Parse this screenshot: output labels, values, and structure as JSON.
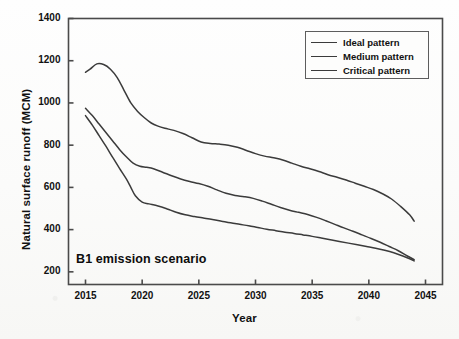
{
  "chart_data": {
    "type": "line",
    "title": "",
    "annotation": "B1 emission scenario",
    "xlabel": "Year",
    "ylabel": "Natural surface runoff (MCM)",
    "xlim": [
      2013.5,
      2046.5
    ],
    "ylim": [
      140,
      1400
    ],
    "xticks": [
      2015,
      2020,
      2025,
      2030,
      2035,
      2040,
      2045
    ],
    "yticks": [
      200,
      400,
      600,
      800,
      1000,
      1200,
      1400
    ],
    "grid": false,
    "legend_position": "top-right",
    "line_color": "#3b3b3b",
    "frame_color": "#4a4a4a",
    "series": [
      {
        "name": "Ideal pattern",
        "x": [
          2015.0,
          2015.4,
          2016.0,
          2016.6,
          2017.2,
          2017.8,
          2018.4,
          2019.0,
          2019.6,
          2020.2,
          2020.8,
          2021.4,
          2022.0,
          2022.8,
          2023.6,
          2024.4,
          2025.2,
          2026.0,
          2026.8,
          2027.6,
          2028.4,
          2029.2,
          2030.0,
          2030.8,
          2031.6,
          2032.4,
          2033.2,
          2034.0,
          2034.8,
          2035.6,
          2036.4,
          2037.2,
          2038.0,
          2038.8,
          2039.6,
          2040.4,
          2041.2,
          2042.0,
          2042.8,
          2043.6,
          2044.0
        ],
        "y": [
          1145,
          1160,
          1185,
          1182,
          1160,
          1120,
          1060,
          1000,
          960,
          930,
          905,
          890,
          880,
          870,
          855,
          835,
          815,
          808,
          805,
          800,
          790,
          775,
          760,
          748,
          740,
          730,
          715,
          700,
          688,
          675,
          660,
          648,
          635,
          620,
          605,
          590,
          570,
          545,
          510,
          470,
          440
        ]
      },
      {
        "name": "Medium pattern",
        "x": [
          2015.0,
          2015.6,
          2016.2,
          2016.8,
          2017.4,
          2018.0,
          2018.6,
          2019.2,
          2019.8,
          2020.4,
          2021.0,
          2021.8,
          2022.6,
          2023.4,
          2024.2,
          2025.0,
          2025.8,
          2026.6,
          2027.4,
          2028.2,
          2029.0,
          2029.8,
          2030.6,
          2031.4,
          2032.2,
          2033.0,
          2033.8,
          2034.6,
          2035.4,
          2036.2,
          2037.0,
          2037.8,
          2038.6,
          2039.4,
          2040.2,
          2041.0,
          2041.8,
          2042.6,
          2043.4,
          2044.0
        ],
        "y": [
          975,
          940,
          900,
          860,
          820,
          780,
          745,
          715,
          700,
          695,
          688,
          672,
          655,
          640,
          628,
          618,
          605,
          588,
          572,
          562,
          556,
          548,
          535,
          520,
          505,
          492,
          482,
          472,
          458,
          442,
          425,
          408,
          392,
          375,
          358,
          340,
          320,
          300,
          275,
          258
        ]
      },
      {
        "name": "Critical pattern",
        "x": [
          2015.0,
          2015.6,
          2016.2,
          2016.8,
          2017.4,
          2018.0,
          2018.6,
          2019.0,
          2019.4,
          2020.0,
          2020.6,
          2021.4,
          2022.2,
          2023.0,
          2023.8,
          2024.6,
          2025.4,
          2026.2,
          2027.0,
          2027.8,
          2028.6,
          2029.4,
          2030.2,
          2031.0,
          2031.8,
          2032.6,
          2033.4,
          2034.2,
          2035.0,
          2035.8,
          2036.6,
          2037.4,
          2038.2,
          2039.0,
          2039.8,
          2040.6,
          2041.4,
          2042.2,
          2043.0,
          2043.6,
          2044.0
        ],
        "y": [
          940,
          895,
          845,
          795,
          742,
          690,
          640,
          600,
          560,
          530,
          522,
          512,
          498,
          482,
          470,
          462,
          455,
          448,
          440,
          432,
          425,
          418,
          410,
          402,
          395,
          388,
          382,
          375,
          368,
          360,
          352,
          344,
          336,
          328,
          320,
          312,
          302,
          290,
          275,
          262,
          252
        ]
      }
    ]
  },
  "legend": {
    "entries": [
      {
        "label": "Ideal pattern"
      },
      {
        "label": "Medium pattern"
      },
      {
        "label": "Critical pattern"
      }
    ]
  }
}
